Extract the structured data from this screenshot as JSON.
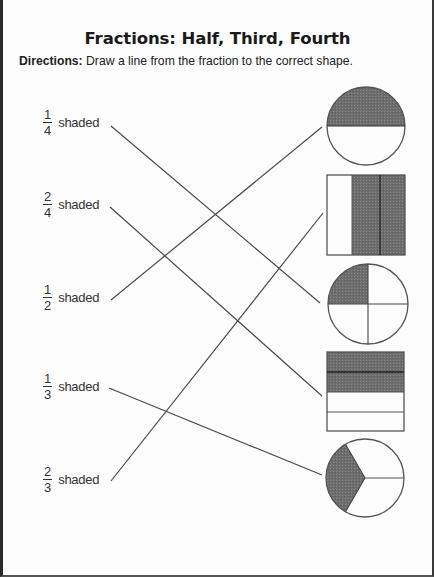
{
  "worksheet": {
    "title": "Fractions: Half, Third, Fourth",
    "directions_label": "Directions:",
    "directions_text": " Draw a line from the fraction to the correct shape."
  },
  "fractions": [
    {
      "numerator": "1",
      "denominator": "4",
      "label": "shaded"
    },
    {
      "numerator": "2",
      "denominator": "4",
      "label": "shaded"
    },
    {
      "numerator": "1",
      "denominator": "2",
      "label": "shaded"
    },
    {
      "numerator": "1",
      "denominator": "3",
      "label": "shaded"
    },
    {
      "numerator": "2",
      "denominator": "3",
      "label": "shaded"
    }
  ],
  "shapes": [
    {
      "type": "circle",
      "parts": 2,
      "shaded": 1,
      "description": "circle halves, top half shaded"
    },
    {
      "type": "rectangle-vertical",
      "parts": 3,
      "shaded": 2,
      "description": "rectangle thirds, right two shaded"
    },
    {
      "type": "circle",
      "parts": 4,
      "shaded": 1,
      "description": "circle quarters, top-left shaded"
    },
    {
      "type": "rectangle-horizontal",
      "parts": 4,
      "shaded": 2,
      "description": "rectangle fourths, top two shaded"
    },
    {
      "type": "circle",
      "parts": 3,
      "shaded": 1,
      "description": "circle thirds, left third shaded"
    }
  ],
  "connections": [
    {
      "fraction": "1/4",
      "shape_index": 2
    },
    {
      "fraction": "2/4",
      "shape_index": 3
    },
    {
      "fraction": "1/2",
      "shape_index": 0
    },
    {
      "fraction": "1/3",
      "shape_index": 4
    },
    {
      "fraction": "2/3",
      "shape_index": 1
    }
  ],
  "colors": {
    "shade": "#6b6b6b",
    "outline": "#555555",
    "line": "#4a4a4a"
  }
}
